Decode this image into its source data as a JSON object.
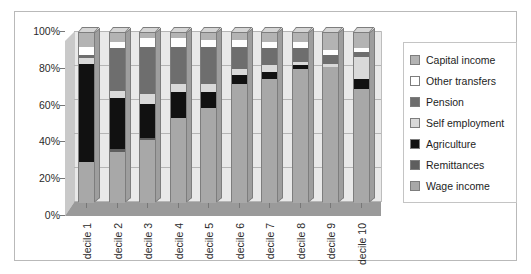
{
  "chart_data": {
    "type": "bar",
    "subtype": "100% stacked bar",
    "title": "",
    "xlabel": "",
    "ylabel": "",
    "ylim": [
      0,
      100
    ],
    "ytick_labels": [
      "0%",
      "20%",
      "40%",
      "60%",
      "80%",
      "100%"
    ],
    "ytick_values": [
      0,
      20,
      40,
      60,
      80,
      100
    ],
    "grid": true,
    "legend_position": "right",
    "categories": [
      "decile 1",
      "decile 2",
      "decile 3",
      "decile 4",
      "decile 5",
      "decile 6",
      "decile 7",
      "decile 8",
      "decile 9",
      "decile 10"
    ],
    "series": [
      {
        "name": "Wage income",
        "color": "#a8a8a8",
        "values": [
          24,
          30,
          37,
          50,
          56,
          70,
          73,
          79,
          80,
          67
        ]
      },
      {
        "name": "Remittances",
        "color": "#5e5e5e",
        "values": [
          0,
          2,
          1,
          0,
          0,
          0,
          0,
          0,
          0,
          0
        ]
      },
      {
        "name": "Agriculture",
        "color": "#111111",
        "values": [
          58,
          30,
          20,
          15,
          9,
          5,
          4,
          2,
          0,
          6
        ]
      },
      {
        "name": "Self employment",
        "color": "#d9d9d9",
        "values": [
          3,
          4,
          6,
          5,
          5,
          4,
          4,
          2,
          2,
          13
        ]
      },
      {
        "name": "Pension",
        "color": "#6e6e6e",
        "values": [
          2,
          25,
          28,
          22,
          22,
          13,
          10,
          8,
          5,
          3
        ]
      },
      {
        "name": "Other transfers",
        "color": "#ffffff",
        "values": [
          5,
          4,
          5,
          5,
          4,
          4,
          4,
          4,
          3,
          2
        ]
      },
      {
        "name": "Capital income",
        "color": "#b3b3b3",
        "values": [
          8,
          5,
          3,
          3,
          4,
          4,
          5,
          5,
          10,
          9
        ]
      }
    ]
  },
  "legend": {
    "items": [
      {
        "label": "Capital income",
        "color": "#b3b3b3"
      },
      {
        "label": "Other transfers",
        "color": "#ffffff"
      },
      {
        "label": "Pension",
        "color": "#6e6e6e"
      },
      {
        "label": "Self employment",
        "color": "#d9d9d9"
      },
      {
        "label": "Agriculture",
        "color": "#111111"
      },
      {
        "label": "Remittances",
        "color": "#5e5e5e"
      },
      {
        "label": "Wage income",
        "color": "#a8a8a8"
      }
    ]
  }
}
